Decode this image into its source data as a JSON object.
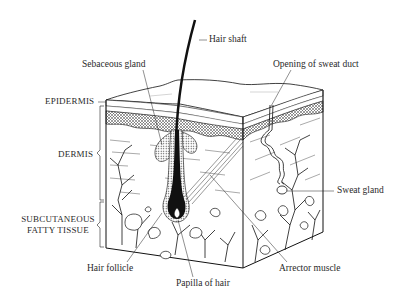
{
  "diagram": {
    "layers": [
      {
        "id": "epidermis",
        "label": "EPIDERMIS"
      },
      {
        "id": "dermis",
        "label": "DERMIS"
      },
      {
        "id": "subcutaneous",
        "label_line1": "SUBCUTANEOUS",
        "label_line2": "FATTY TISSUE"
      }
    ],
    "structures": {
      "hair_shaft": "Hair shaft",
      "sebaceous_gland": "Sebaceous gland",
      "opening_of_sweat_duct": "Opening of sweat duct",
      "sweat_gland": "Sweat gland",
      "hair_follicle": "Hair follicle",
      "papilla_of_hair": "Papilla of hair",
      "arrector_muscle": "Arrector muscle"
    },
    "colors": {
      "ink": "#111111",
      "label": "#2a2a2a",
      "background": "#ffffff"
    }
  }
}
